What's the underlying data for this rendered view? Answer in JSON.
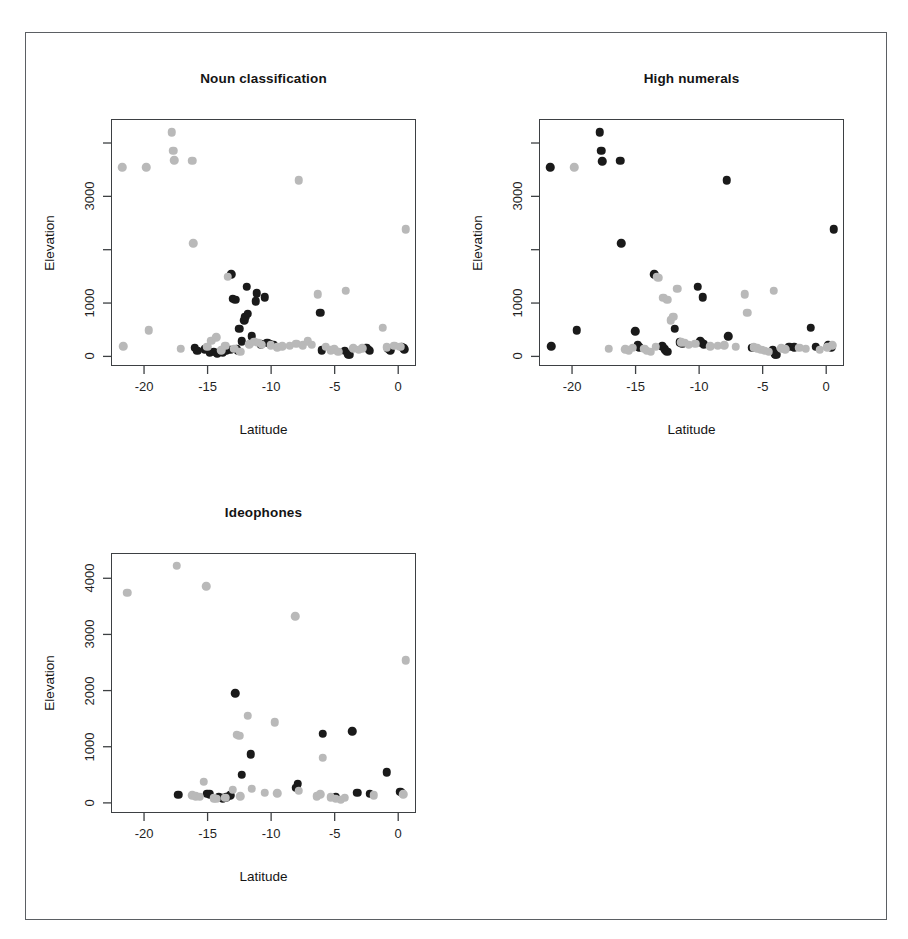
{
  "figure": {
    "background_color": "#ffffff",
    "frame_color": "#5b5f63",
    "point_color_dark": "#1a1a1a",
    "point_color_light": "#b9b9b9"
  },
  "chart_data": [
    {
      "type": "scatter",
      "title": "Noun classification",
      "xlabel": "Latitude",
      "ylabel": "Elevation",
      "xlim": [
        -22.6,
        1.4
      ],
      "ylim": [
        -180,
        4450
      ],
      "grid": false,
      "legend": "none",
      "xticks": [
        -20,
        -15,
        -10,
        -5,
        0
      ],
      "xtick_labels": [
        "-20",
        "-15",
        "-10",
        "-5",
        "0"
      ],
      "yticks": [
        0,
        1000,
        2000,
        3000,
        4000
      ],
      "ytick_labels": [
        "0",
        "1000",
        "",
        "3000",
        ""
      ],
      "series": [
        {
          "name": "dark",
          "color": "#1a1a1a",
          "points": [
            [
              -16.1,
              180
            ],
            [
              -15.9,
              120
            ],
            [
              -15.3,
              150
            ],
            [
              -14.9,
              95
            ],
            [
              -14.6,
              110
            ],
            [
              -14.3,
              80
            ],
            [
              -13.9,
              90
            ],
            [
              -13.6,
              130
            ],
            [
              -13.3,
              140
            ],
            [
              -13.2,
              1560
            ],
            [
              -13.1,
              1100
            ],
            [
              -12.9,
              1080
            ],
            [
              -12.8,
              165
            ],
            [
              -12.7,
              120
            ],
            [
              -12.6,
              540
            ],
            [
              -12.4,
              300
            ],
            [
              -12.2,
              700
            ],
            [
              -12.1,
              760
            ],
            [
              -12.0,
              1320
            ],
            [
              -11.9,
              820
            ],
            [
              -11.6,
              400
            ],
            [
              -11.3,
              1050
            ],
            [
              -11.2,
              1200
            ],
            [
              -10.9,
              250
            ],
            [
              -10.6,
              1130
            ],
            [
              -10.4,
              270
            ],
            [
              -10.2,
              260
            ],
            [
              -9.9,
              240
            ],
            [
              -6.2,
              840
            ],
            [
              -6.1,
              130
            ],
            [
              -4.3,
              120
            ],
            [
              -4.0,
              60
            ],
            [
              -3.9,
              50
            ],
            [
              -2.6,
              180
            ],
            [
              -2.4,
              140
            ],
            [
              -2.3,
              120
            ],
            [
              -0.9,
              160
            ],
            [
              -0.7,
              130
            ],
            [
              0.2,
              200
            ],
            [
              0.3,
              180
            ],
            [
              0.4,
              150
            ]
          ]
        },
        {
          "name": "light",
          "color": "#b9b9b9",
          "points": [
            [
              -21.8,
              3560
            ],
            [
              -21.7,
              210
            ],
            [
              -19.9,
              3560
            ],
            [
              -19.7,
              510
            ],
            [
              -17.9,
              4220
            ],
            [
              -17.8,
              3870
            ],
            [
              -17.7,
              3700
            ],
            [
              -17.2,
              160
            ],
            [
              -16.3,
              3690
            ],
            [
              -16.2,
              2140
            ],
            [
              -15.1,
              200
            ],
            [
              -14.8,
              310
            ],
            [
              -14.4,
              380
            ],
            [
              -14.0,
              130
            ],
            [
              -13.7,
              220
            ],
            [
              -13.5,
              1510
            ],
            [
              -13.0,
              160
            ],
            [
              -12.5,
              110
            ],
            [
              -11.8,
              250
            ],
            [
              -11.4,
              290
            ],
            [
              -11.1,
              270
            ],
            [
              -10.8,
              240
            ],
            [
              -10.1,
              230
            ],
            [
              -9.6,
              190
            ],
            [
              -9.2,
              210
            ],
            [
              -8.6,
              220
            ],
            [
              -8.1,
              260
            ],
            [
              -7.9,
              3320
            ],
            [
              -7.6,
              230
            ],
            [
              -7.2,
              300
            ],
            [
              -6.9,
              240
            ],
            [
              -6.4,
              1180
            ],
            [
              -5.8,
              200
            ],
            [
              -5.4,
              130
            ],
            [
              -5.1,
              150
            ],
            [
              -4.8,
              110
            ],
            [
              -4.2,
              1250
            ],
            [
              -3.6,
              170
            ],
            [
              -3.2,
              140
            ],
            [
              -2.9,
              170
            ],
            [
              -1.3,
              560
            ],
            [
              -1.0,
              190
            ],
            [
              -0.4,
              220
            ],
            [
              0.1,
              200
            ],
            [
              0.5,
              2400
            ]
          ]
        }
      ]
    },
    {
      "type": "scatter",
      "title": "High numerals",
      "xlabel": "Latitude",
      "ylabel": "Elevation",
      "xlim": [
        -22.6,
        1.4
      ],
      "ylim": [
        -180,
        4450
      ],
      "grid": false,
      "legend": "none",
      "xticks": [
        -20,
        -15,
        -10,
        -5,
        0
      ],
      "xtick_labels": [
        "-20",
        "-15",
        "-10",
        "-5",
        "0"
      ],
      "yticks": [
        0,
        1000,
        2000,
        3000,
        4000
      ],
      "ytick_labels": [
        "0",
        "1000",
        "",
        "3000",
        ""
      ],
      "series": [
        {
          "name": "dark",
          "color": "#1a1a1a",
          "points": [
            [
              -21.8,
              3560
            ],
            [
              -21.7,
              210
            ],
            [
              -19.7,
              510
            ],
            [
              -17.9,
              4220
            ],
            [
              -17.8,
              3870
            ],
            [
              -17.7,
              3680
            ],
            [
              -16.3,
              3690
            ],
            [
              -16.2,
              2140
            ],
            [
              -15.1,
              490
            ],
            [
              -14.9,
              230
            ],
            [
              -14.8,
              190
            ],
            [
              -13.6,
              1560
            ],
            [
              -13.0,
              210
            ],
            [
              -12.8,
              150
            ],
            [
              -12.7,
              120
            ],
            [
              -12.6,
              110
            ],
            [
              -12.0,
              540
            ],
            [
              -11.6,
              280
            ],
            [
              -11.4,
              260
            ],
            [
              -10.2,
              1320
            ],
            [
              -10.0,
              300
            ],
            [
              -9.9,
              270
            ],
            [
              -9.8,
              1130
            ],
            [
              -9.7,
              250
            ],
            [
              -7.9,
              3320
            ],
            [
              -7.8,
              400
            ],
            [
              -5.9,
              180
            ],
            [
              -4.3,
              130
            ],
            [
              -4.1,
              60
            ],
            [
              -4.0,
              50
            ],
            [
              -3.0,
              200
            ],
            [
              -2.6,
              190
            ],
            [
              -1.3,
              560
            ],
            [
              -0.9,
              200
            ],
            [
              0.1,
              230
            ],
            [
              0.2,
              210
            ],
            [
              0.3,
              190
            ],
            [
              0.5,
              2400
            ]
          ]
        },
        {
          "name": "light",
          "color": "#b9b9b9",
          "points": [
            [
              -19.9,
              3560
            ],
            [
              -17.2,
              160
            ],
            [
              -15.9,
              150
            ],
            [
              -15.6,
              130
            ],
            [
              -15.3,
              180
            ],
            [
              -14.4,
              160
            ],
            [
              -14.2,
              120
            ],
            [
              -13.9,
              110
            ],
            [
              -13.5,
              200
            ],
            [
              -13.4,
              1510
            ],
            [
              -13.3,
              1490
            ],
            [
              -12.9,
              1120
            ],
            [
              -12.6,
              1080
            ],
            [
              -12.3,
              700
            ],
            [
              -12.1,
              760
            ],
            [
              -11.8,
              1290
            ],
            [
              -11.5,
              280
            ],
            [
              -11.2,
              270
            ],
            [
              -10.9,
              240
            ],
            [
              -10.4,
              260
            ],
            [
              -9.2,
              210
            ],
            [
              -8.6,
              220
            ],
            [
              -8.1,
              230
            ],
            [
              -7.2,
              200
            ],
            [
              -6.5,
              1180
            ],
            [
              -6.3,
              840
            ],
            [
              -5.8,
              190
            ],
            [
              -5.5,
              170
            ],
            [
              -5.2,
              140
            ],
            [
              -4.9,
              120
            ],
            [
              -4.6,
              110
            ],
            [
              -4.2,
              1250
            ],
            [
              -3.6,
              170
            ],
            [
              -3.3,
              150
            ],
            [
              -2.2,
              180
            ],
            [
              -1.7,
              160
            ],
            [
              -0.6,
              140
            ],
            [
              0.0,
              190
            ],
            [
              0.4,
              230
            ]
          ]
        }
      ]
    },
    {
      "type": "scatter",
      "title": "Ideophones",
      "xlabel": "Latitude",
      "ylabel": "Elevation",
      "xlim": [
        -22.6,
        1.4
      ],
      "ylim": [
        -180,
        4450
      ],
      "grid": false,
      "legend": "none",
      "xticks": [
        -20,
        -15,
        -10,
        -5,
        0
      ],
      "xtick_labels": [
        "-20",
        "-15",
        "-10",
        "-5",
        "0"
      ],
      "yticks": [
        0,
        1000,
        2000,
        3000,
        4000
      ],
      "ytick_labels": [
        "0",
        "1000",
        "2000",
        "3000",
        "4000"
      ],
      "series": [
        {
          "name": "dark",
          "color": "#1a1a1a",
          "points": [
            [
              -17.4,
              160
            ],
            [
              -15.1,
              180
            ],
            [
              -14.9,
              170
            ],
            [
              -14.2,
              130
            ],
            [
              -14.0,
              110
            ],
            [
              -13.9,
              100
            ],
            [
              -13.6,
              120
            ],
            [
              -13.3,
              150
            ],
            [
              -12.9,
              1970
            ],
            [
              -12.4,
              520
            ],
            [
              -11.7,
              880
            ],
            [
              -8.0,
              360
            ],
            [
              -8.1,
              290
            ],
            [
              -6.0,
              1250
            ],
            [
              -5.0,
              120
            ],
            [
              -3.7,
              1290
            ],
            [
              -3.3,
              200
            ],
            [
              -2.3,
              180
            ],
            [
              -1.0,
              560
            ],
            [
              0.1,
              220
            ],
            [
              0.2,
              200
            ]
          ]
        },
        {
          "name": "light",
          "color": "#b9b9b9",
          "points": [
            [
              -21.4,
              3760
            ],
            [
              -17.5,
              4240
            ],
            [
              -16.3,
              150
            ],
            [
              -16.0,
              140
            ],
            [
              -15.7,
              130
            ],
            [
              -15.4,
              390
            ],
            [
              -15.2,
              3880
            ],
            [
              -14.6,
              100
            ],
            [
              -14.4,
              90
            ],
            [
              -13.7,
              110
            ],
            [
              -13.1,
              250
            ],
            [
              -12.8,
              1230
            ],
            [
              -12.6,
              1210
            ],
            [
              -12.5,
              140
            ],
            [
              -11.9,
              1570
            ],
            [
              -11.6,
              270
            ],
            [
              -10.6,
              200
            ],
            [
              -9.8,
              1450
            ],
            [
              -9.6,
              190
            ],
            [
              -8.2,
              3340
            ],
            [
              -7.9,
              230
            ],
            [
              -6.5,
              140
            ],
            [
              -6.2,
              170
            ],
            [
              -6.0,
              820
            ],
            [
              -5.4,
              120
            ],
            [
              -5.0,
              90
            ],
            [
              -4.6,
              70
            ],
            [
              -4.3,
              110
            ],
            [
              -2.0,
              150
            ],
            [
              0.3,
              170
            ],
            [
              0.5,
              2560
            ]
          ]
        }
      ]
    }
  ]
}
